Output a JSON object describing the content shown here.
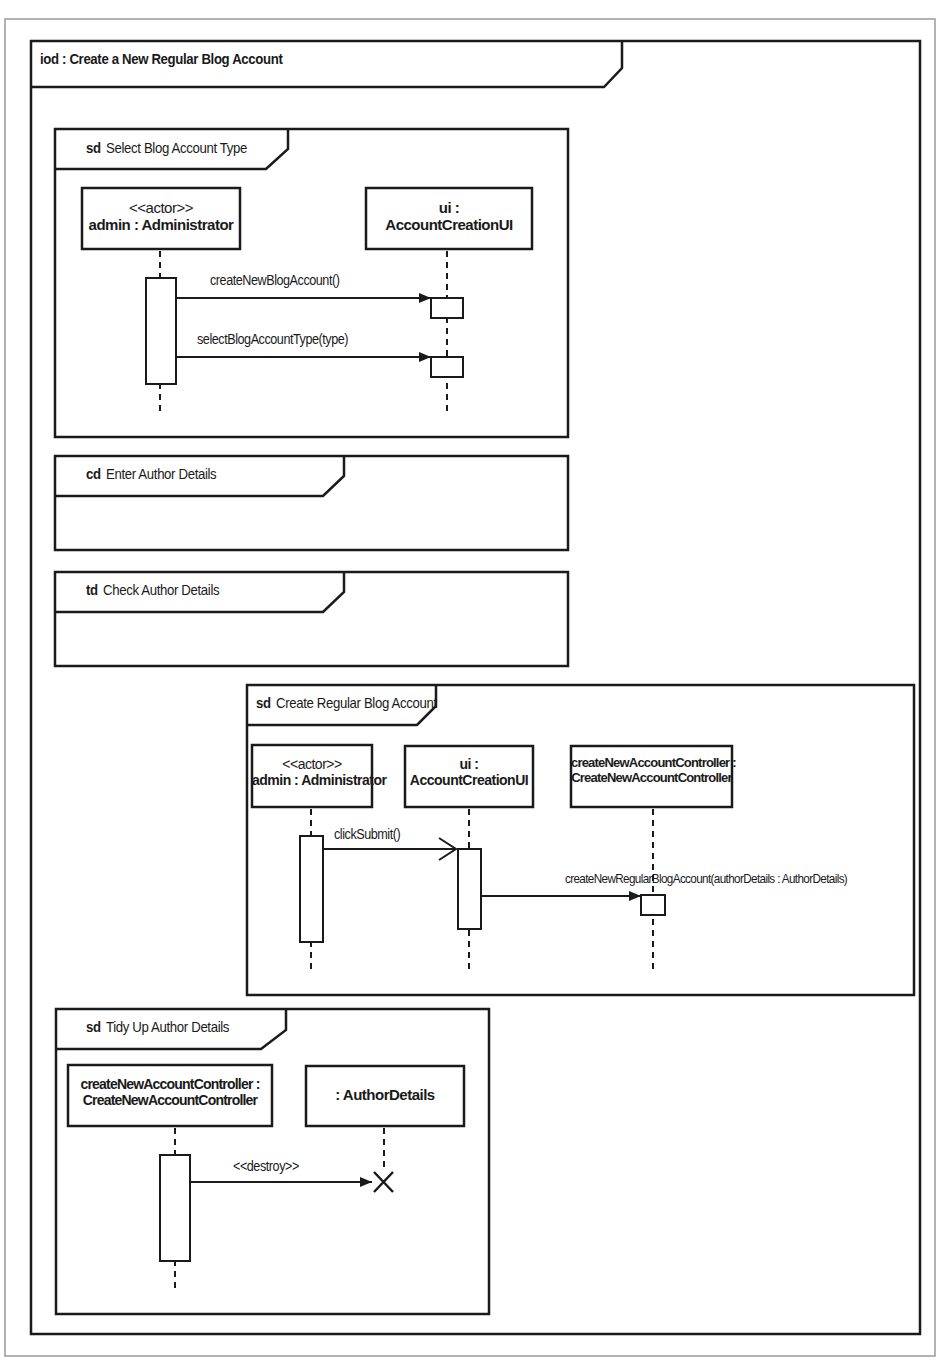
{
  "diagram": {
    "type": "UML interaction overview diagram",
    "frame": {
      "kind": "iod",
      "title": "iod : Create a New Regular Blog Account"
    },
    "fragments": [
      {
        "kind": "sd",
        "name": "Select Blog Account Type",
        "lifelines": [
          {
            "line1": "<<actor>>",
            "line2": "admin : Administrator"
          },
          {
            "line1": "ui :",
            "line2": "AccountCreationUI"
          }
        ],
        "messages": [
          {
            "label": "createNewBlogAccount()",
            "from": 0,
            "to": 1,
            "arrow": "synchronous"
          },
          {
            "label": "selectBlogAccountType(type)",
            "from": 0,
            "to": 1,
            "arrow": "synchronous"
          }
        ]
      },
      {
        "kind": "cd",
        "name": "Enter Author Details"
      },
      {
        "kind": "td",
        "name": "Check Author Details"
      },
      {
        "kind": "sd",
        "name": "Create Regular Blog Account",
        "lifelines": [
          {
            "line1": "<<actor>>",
            "line2": "admin : Administrator"
          },
          {
            "line1": "ui :",
            "line2": "AccountCreationUI"
          },
          {
            "line1": "createNewAccountController :",
            "line2": "CreateNewAccountController"
          }
        ],
        "messages": [
          {
            "label": "clickSubmit()",
            "from": 0,
            "to": 1,
            "arrow": "asynchronous"
          },
          {
            "label": "createNewRegularBlogAccount(authorDetails : AuthorDetails)",
            "from": 1,
            "to": 2,
            "arrow": "synchronous"
          }
        ]
      },
      {
        "kind": "sd",
        "name": "Tidy Up Author Details",
        "lifelines": [
          {
            "line1": "createNewAccountController :",
            "line2": "CreateNewAccountController"
          },
          {
            "line1": "",
            "line2": ": AuthorDetails"
          }
        ],
        "messages": [
          {
            "label": "<<destroy>>",
            "from": 0,
            "to": 1,
            "arrow": "synchronous",
            "terminates": true
          }
        ]
      }
    ]
  },
  "colors": {
    "line": "#1a1a1a",
    "outer_border": "#9a9a9a",
    "background": "#ffffff"
  }
}
